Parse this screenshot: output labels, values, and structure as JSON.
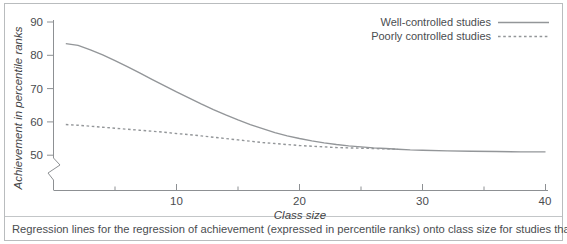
{
  "figure": {
    "caption": "Regression lines for the regression of achievement (expressed in percentile ranks) onto class size for studies that"
  },
  "chart_data": {
    "type": "line",
    "title": "",
    "xlabel": "Class size",
    "ylabel": "Achievement in percentile ranks",
    "xlim": [
      0,
      40
    ],
    "ylim": [
      45,
      90
    ],
    "y_axis_break": true,
    "grid": false,
    "legend_position": "top-right",
    "xticks": [
      10,
      20,
      30,
      40
    ],
    "xtick_labels": [
      "10",
      "20",
      "30",
      "40"
    ],
    "xminor_ticks": [
      5,
      15,
      25,
      35
    ],
    "yticks": [
      50,
      60,
      70,
      80,
      90
    ],
    "ytick_labels": [
      "50",
      "60",
      "70",
      "80",
      "90"
    ],
    "series": [
      {
        "name": "Well-controlled studies",
        "style": "solid",
        "color": "#939699",
        "x": [
          1,
          2,
          3,
          4,
          5,
          6,
          7,
          8,
          9,
          10,
          11,
          12,
          13,
          14,
          15,
          16,
          17,
          18,
          19,
          20,
          21,
          22,
          23,
          24,
          25,
          26,
          27,
          28,
          29,
          30,
          32,
          34,
          36,
          38,
          40
        ],
        "values": [
          83.5,
          83.0,
          81.6,
          80.1,
          78.4,
          76.6,
          74.7,
          72.8,
          70.9,
          69.0,
          67.2,
          65.4,
          63.7,
          62.1,
          60.6,
          59.2,
          58.0,
          56.8,
          55.8,
          55.0,
          54.3,
          53.7,
          53.2,
          52.8,
          52.5,
          52.2,
          52.0,
          51.8,
          51.6,
          51.5,
          51.3,
          51.2,
          51.1,
          51.0,
          51.0
        ]
      },
      {
        "name": "Poorly controlled studies",
        "style": "dashed",
        "color": "#939699",
        "x": [
          1,
          2,
          3,
          4,
          5,
          6,
          7,
          8,
          9,
          10,
          11,
          12,
          13,
          14,
          15,
          16,
          17,
          18,
          19,
          20,
          21,
          22,
          23,
          24,
          25,
          26,
          27,
          28
        ],
        "values": [
          59.2,
          59.0,
          58.7,
          58.4,
          58.1,
          57.8,
          57.5,
          57.2,
          56.9,
          56.5,
          56.2,
          55.8,
          55.4,
          55.0,
          54.6,
          54.2,
          53.8,
          53.5,
          53.2,
          52.9,
          52.7,
          52.5,
          52.3,
          52.2,
          52.1,
          52.0,
          51.9,
          51.8
        ]
      }
    ],
    "legend": [
      {
        "label": "Well-controlled studies",
        "style": "solid"
      },
      {
        "label": "Poorly controlled studies",
        "style": "dashed"
      }
    ]
  }
}
